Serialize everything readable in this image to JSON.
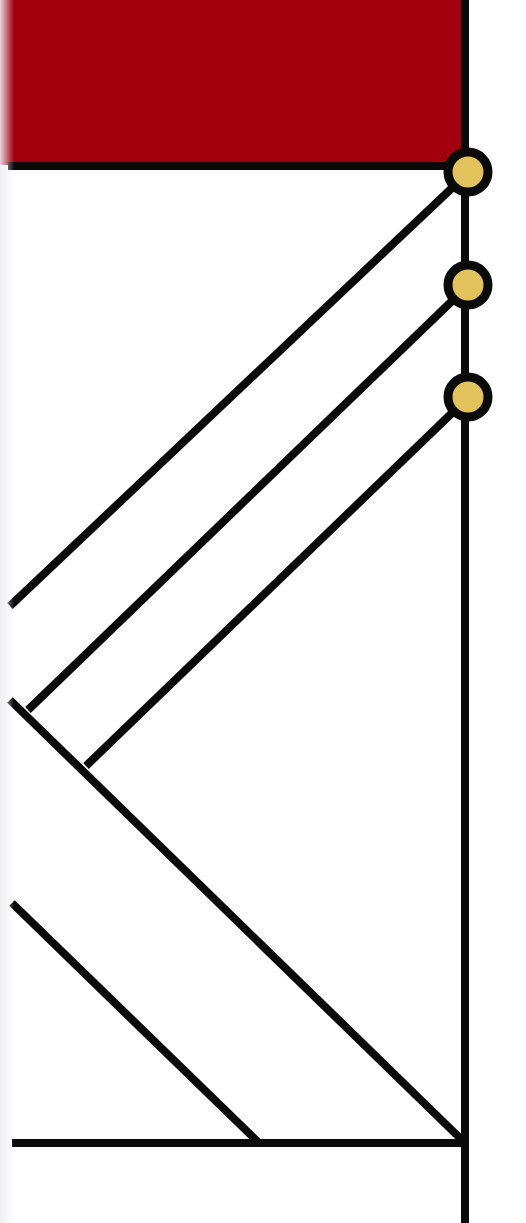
{
  "diagram": {
    "type": "cladogram",
    "title": "",
    "colors": {
      "background": "#ffffff",
      "highlight_block": "#a3000f",
      "line": "#0a0a0a",
      "node_fill": "#e2c25a",
      "node_stroke": "#0a0a0a"
    },
    "highlight_block": {
      "x": 0,
      "y": 0,
      "width": 462,
      "height": 165
    },
    "trunk": {
      "x": 465,
      "y1": 0,
      "y2": 1223
    },
    "nodes": [
      {
        "id": "node-1",
        "cx": 468,
        "cy": 172,
        "r": 24
      },
      {
        "id": "node-2",
        "cx": 468,
        "cy": 285,
        "r": 24
      },
      {
        "id": "node-3",
        "cx": 468,
        "cy": 397,
        "r": 24
      }
    ],
    "branches": [
      {
        "id": "top-horizontal",
        "x1": 8,
        "y1": 166,
        "x2": 448,
        "y2": 166
      },
      {
        "id": "diagonal-1",
        "x1": 10,
        "y1": 606,
        "x2": 452,
        "y2": 188
      },
      {
        "id": "diagonal-2",
        "x1": 28,
        "y1": 710,
        "x2": 452,
        "y2": 301
      },
      {
        "id": "diagonal-3",
        "x1": 86,
        "y1": 766,
        "x2": 452,
        "y2": 413
      },
      {
        "id": "long-descending",
        "x1": 10,
        "y1": 700,
        "x2": 464,
        "y2": 1142
      },
      {
        "id": "lower-descending",
        "x1": 12,
        "y1": 903,
        "x2": 258,
        "y2": 1142
      },
      {
        "id": "bottom-horizontal",
        "x1": 12,
        "y1": 1143,
        "x2": 465,
        "y2": 1143
      }
    ],
    "line_width": 8
  }
}
